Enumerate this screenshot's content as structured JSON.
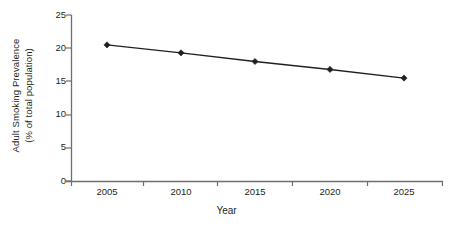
{
  "chart_data": {
    "type": "line",
    "title": "",
    "xlabel": "Year",
    "ylabel": "Adult Smoking Prevalence (% of total population)",
    "ylabel_line1": "Adult Smoking Prevalence",
    "ylabel_line2": "(% of total population)",
    "categories": [
      "2005",
      "2010",
      "2015",
      "2020",
      "2025"
    ],
    "x": [
      2005,
      2010,
      2015,
      2020,
      2025
    ],
    "values": [
      20.5,
      19.3,
      18.0,
      16.8,
      15.5
    ],
    "series": [
      {
        "name": "Adult Smoking Prevalence",
        "values": [
          20.5,
          19.3,
          18.0,
          16.8,
          15.5
        ]
      }
    ],
    "ylim": [
      0,
      25
    ],
    "yticks": [
      "0",
      "5",
      "10",
      "15",
      "20",
      "25"
    ],
    "ytick_values": [
      0,
      5,
      10,
      15,
      20,
      25
    ],
    "xticks": [
      "2005",
      "2010",
      "2015",
      "2020",
      "2025"
    ],
    "grid": false,
    "legend": false,
    "marker": "diamond",
    "line_color": "#231f20",
    "marker_color": "#231f20",
    "axis_color": "#6d6e71",
    "background": "#ffffff"
  }
}
